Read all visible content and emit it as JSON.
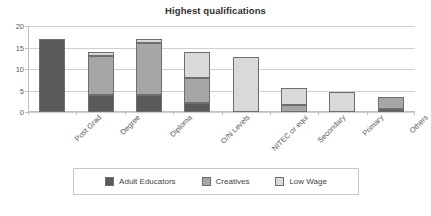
{
  "chart_data": {
    "type": "bar",
    "subtype": "stacked-vertical",
    "title": "Highest qualifications",
    "xlabel": "",
    "ylabel": "",
    "ylim": [
      0,
      20
    ],
    "yticks": [
      0,
      5,
      10,
      15,
      20
    ],
    "grid": true,
    "legend_position": "bottom",
    "categories": [
      "Post Grad",
      "Degree",
      "Diploma",
      "O/N Levels",
      "NITEC or equi",
      "Secondary",
      "Primary",
      "Others"
    ],
    "series": [
      {
        "name": "Adult Educators",
        "color": "#595959",
        "values": [
          17,
          4,
          4,
          2,
          0,
          0,
          0,
          0.8
        ]
      },
      {
        "name": "Creatives",
        "color": "#a6a6a6",
        "values": [
          0,
          9,
          12,
          6,
          0,
          1.7,
          0,
          2.8
        ]
      },
      {
        "name": "Low Wage",
        "color": "#d9d9d9",
        "values": [
          0,
          1,
          1,
          6,
          12.8,
          4,
          4.7,
          0
        ]
      }
    ],
    "totals": [
      17,
      14,
      17,
      14,
      12.8,
      5.7,
      4.7,
      3.6
    ]
  },
  "legend": {
    "items": [
      {
        "label": "Adult Educators",
        "color": "#595959"
      },
      {
        "label": "Creatives",
        "color": "#a6a6a6"
      },
      {
        "label": "Low Wage",
        "color": "#d9d9d9"
      }
    ]
  }
}
